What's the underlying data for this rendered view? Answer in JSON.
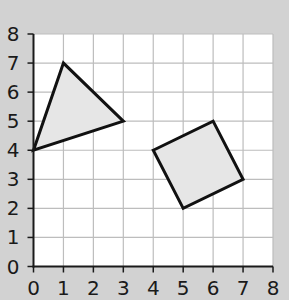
{
  "chart_data": {
    "type": "scatter",
    "title": "",
    "xlabel": "",
    "ylabel": "",
    "xlim": [
      0,
      8
    ],
    "ylim": [
      0,
      8
    ],
    "grid": true,
    "x_ticks": [
      "0",
      "1",
      "2",
      "3",
      "4",
      "5",
      "6",
      "7",
      "8"
    ],
    "y_ticks": [
      "0",
      "1",
      "2",
      "3",
      "4",
      "5",
      "6",
      "7",
      "8"
    ],
    "shapes": [
      {
        "name": "triangle",
        "vertices": [
          [
            0,
            4
          ],
          [
            1,
            7
          ],
          [
            3,
            5
          ]
        ],
        "fill": "#e6e6e6",
        "stroke": "#111111"
      },
      {
        "name": "square",
        "vertices": [
          [
            4,
            4
          ],
          [
            6,
            5
          ],
          [
            7,
            3
          ],
          [
            5,
            2
          ]
        ],
        "fill": "#e6e6e6",
        "stroke": "#111111"
      }
    ]
  },
  "colors": {
    "background": "#d2d2d2",
    "plot_area": "#ffffff",
    "grid": "#bdbdbd",
    "axis": "#1a1a1a"
  }
}
